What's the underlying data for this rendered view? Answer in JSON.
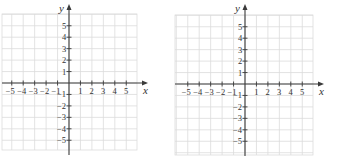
{
  "graphs": [
    {
      "id": "left",
      "origin": [
        69,
        83
      ],
      "unit": 11.45,
      "grid": {
        "x0": 2,
        "x1": 137,
        "y0": 14,
        "y1": 150
      },
      "x_axis": {
        "from": 2,
        "to": 148,
        "label": "x"
      },
      "y_axis": {
        "from": 155,
        "to": 4,
        "label": "y"
      },
      "x_ticks": [
        -5,
        -4,
        -3,
        -2,
        -1,
        1,
        2,
        3,
        4,
        5
      ],
      "y_ticks": [
        5,
        4,
        3,
        2,
        1,
        -1,
        -2,
        -3,
        -4,
        -5
      ]
    },
    {
      "id": "right",
      "origin": [
        245,
        84
      ],
      "unit": 11.45,
      "grid": {
        "x0": 175,
        "x1": 313,
        "y0": 15,
        "y1": 155
      },
      "x_axis": {
        "from": 175,
        "to": 324,
        "label": "x"
      },
      "y_axis": {
        "from": 156,
        "to": 4,
        "label": "y"
      },
      "x_ticks": [
        -5,
        -4,
        -3,
        -2,
        -1,
        1,
        2,
        3,
        4,
        5
      ],
      "y_ticks": [
        5,
        4,
        3,
        2,
        1,
        -1,
        -2,
        -3,
        -4,
        -5
      ]
    }
  ],
  "colors": {
    "grid": "#dcdcdc",
    "axis": "#3a3a3a",
    "text": "#333333"
  }
}
